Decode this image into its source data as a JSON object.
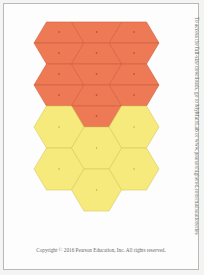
{
  "document": {
    "side_note": "To access the full-size downloads, go to MyMathLab or www.pearsonhighered.com/mathstationeries",
    "copyright": "Copyright © 2016 Pearson Education, Inc. All rights reserved."
  },
  "colors": {
    "orange_fill": "#ee7a55",
    "orange_stroke": "#c9603f",
    "yellow_fill": "#f6ea7c",
    "yellow_stroke": "#d9c95a",
    "dot": "#a8432a"
  },
  "shapes": {
    "orange_half_hexagons": 13,
    "yellow_hexagons": 6
  }
}
